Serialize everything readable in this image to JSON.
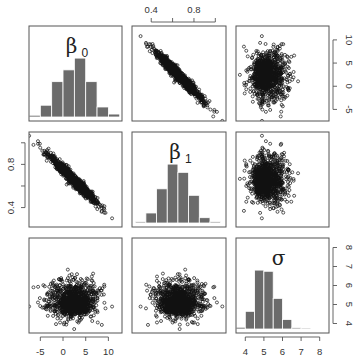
{
  "chart_data": {
    "type": "scatter",
    "layout": "pairs-matrix-3x3",
    "variables": [
      {
        "name": "beta0",
        "label": "β",
        "subscript": "0",
        "range": [
          -7.5,
          13
        ],
        "ticks": [
          -5,
          0,
          5,
          10
        ]
      },
      {
        "name": "beta1",
        "label": "β",
        "subscript": "1",
        "range": [
          0.22,
          1.1
        ],
        "ticks": [
          0.4,
          0.6,
          0.8,
          1.0
        ],
        "tick_labels": [
          "0.4",
          "",
          "0.8",
          ""
        ]
      },
      {
        "name": "sigma",
        "label": "σ",
        "subscript": "",
        "range": [
          3.5,
          8.5
        ],
        "ticks": [
          4,
          5,
          6,
          7,
          8
        ]
      }
    ],
    "axes": {
      "top": {
        "column": 1,
        "ticks": [
          "0.4",
          "0.8"
        ]
      },
      "right_row0": {
        "ticks": [
          "-5",
          "0",
          "5",
          "10"
        ]
      },
      "left_row1": {
        "ticks": [
          "0.4",
          "0.8"
        ]
      },
      "right_row2": {
        "ticks": [
          "4",
          "5",
          "6",
          "7",
          "8"
        ]
      },
      "bottom_col0": {
        "ticks": [
          "-5",
          "0",
          "5",
          "10"
        ]
      },
      "bottom_col2": {
        "ticks": [
          "4",
          "5",
          "6",
          "7",
          "8"
        ]
      }
    },
    "histograms": [
      {
        "variable": "beta0",
        "bin_edges": [
          -7.5,
          -5,
          -2.5,
          0,
          2.5,
          5,
          7.5,
          10,
          12.5
        ],
        "relative_heights": [
          0.03,
          0.2,
          0.6,
          0.8,
          1.0,
          0.6,
          0.17,
          0.05
        ]
      },
      {
        "variable": "beta1",
        "bin_edges": [
          0.25,
          0.35,
          0.45,
          0.55,
          0.65,
          0.75,
          0.85,
          0.95,
          1.05
        ],
        "relative_heights": [
          0.02,
          0.17,
          0.58,
          1.0,
          0.86,
          0.47,
          0.09,
          0.02
        ]
      },
      {
        "variable": "sigma",
        "bin_edges": [
          3.5,
          4,
          4.5,
          5,
          5.5,
          6,
          6.5,
          7,
          7.5
        ],
        "relative_heights": [
          0.03,
          0.3,
          1.0,
          0.98,
          0.52,
          0.16,
          0.02,
          0.01
        ]
      }
    ],
    "scatter": {
      "n_points": 1000,
      "beta0_mean": 2.3,
      "beta0_sd": 2.6,
      "beta1_mean": 0.66,
      "beta1_sd": 0.11,
      "sigma_mean": 5.1,
      "sigma_sd": 0.5,
      "corr_beta0_beta1": -0.97,
      "corr_beta0_sigma": 0.0,
      "corr_beta1_sigma": 0.0
    },
    "title": "",
    "xlabel": "",
    "ylabel": "",
    "grid": false,
    "legend": null
  },
  "colors": {
    "bar_fill": "#6b6b6b",
    "bar_stroke": "#ffffff",
    "point_stroke": "#111111",
    "frame": "#555555",
    "background": "#ffffff"
  }
}
